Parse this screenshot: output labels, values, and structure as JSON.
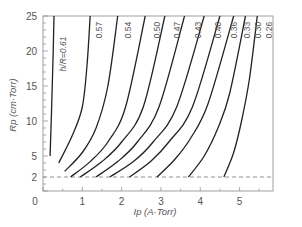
{
  "chart_data": {
    "type": "line",
    "title": "",
    "xlabel": "Ip (A·Torr)",
    "ylabel": "Rp (cm·Torr)",
    "xlim": [
      0,
      5.85
    ],
    "ylim": [
      0,
      25
    ],
    "x_ticks": [
      0,
      1,
      2,
      3,
      4,
      5
    ],
    "y_ticks": [
      2,
      5,
      10,
      15,
      20,
      25
    ],
    "y_minor_step": 1,
    "grid": false,
    "reference_line": {
      "y": 2,
      "style": "dashed"
    },
    "legend_prefix": "h/R=",
    "series": [
      {
        "name": "0.61",
        "points": [
          [
            0.18,
            5
          ],
          [
            0.22,
            12
          ],
          [
            0.26,
            20
          ],
          [
            0.28,
            25
          ]
        ]
      },
      {
        "name": "0.57",
        "points": [
          [
            0.4,
            4
          ],
          [
            0.75,
            8
          ],
          [
            1.0,
            12
          ],
          [
            1.12,
            18
          ],
          [
            1.2,
            25
          ]
        ]
      },
      {
        "name": "0.54",
        "points": [
          [
            0.55,
            2.8
          ],
          [
            1.0,
            5.5
          ],
          [
            1.35,
            9
          ],
          [
            1.65,
            15
          ],
          [
            1.9,
            25
          ]
        ]
      },
      {
        "name": "0.50",
        "points": [
          [
            0.7,
            2
          ],
          [
            1.2,
            4.2
          ],
          [
            1.65,
            7
          ],
          [
            2.1,
            12
          ],
          [
            2.6,
            25
          ]
        ]
      },
      {
        "name": "0.47",
        "points": [
          [
            0.95,
            2
          ],
          [
            1.5,
            4.2
          ],
          [
            2.0,
            7
          ],
          [
            2.55,
            12
          ],
          [
            3.1,
            25
          ]
        ]
      },
      {
        "name": "0.43",
        "points": [
          [
            1.35,
            2
          ],
          [
            1.9,
            4.2
          ],
          [
            2.4,
            7
          ],
          [
            2.95,
            12
          ],
          [
            3.6,
            25
          ]
        ]
      },
      {
        "name": "0.40",
        "points": [
          [
            1.7,
            2
          ],
          [
            2.3,
            4.2
          ],
          [
            2.8,
            7
          ],
          [
            3.4,
            12
          ],
          [
            4.1,
            25
          ]
        ]
      },
      {
        "name": "0.36",
        "points": [
          [
            2.2,
            2
          ],
          [
            2.75,
            4.3
          ],
          [
            3.2,
            7
          ],
          [
            3.8,
            12
          ],
          [
            4.5,
            25
          ]
        ]
      },
      {
        "name": "0.33",
        "points": [
          [
            2.9,
            2
          ],
          [
            3.35,
            4.5
          ],
          [
            3.75,
            7.5
          ],
          [
            4.2,
            12.5
          ],
          [
            4.85,
            25
          ]
        ]
      },
      {
        "name": "0.30",
        "points": [
          [
            3.7,
            2
          ],
          [
            4.1,
            5
          ],
          [
            4.45,
            9
          ],
          [
            4.75,
            14
          ],
          [
            5.15,
            25
          ]
        ]
      },
      {
        "name": "0.26",
        "points": [
          [
            4.6,
            2
          ],
          [
            4.85,
            5.5
          ],
          [
            5.05,
            10
          ],
          [
            5.25,
            16
          ],
          [
            5.45,
            25
          ]
        ]
      }
    ]
  },
  "labels": {
    "y_axis": "Rp (cm·Torr)",
    "x_axis": "Ip (A·Torr)",
    "curve_labels": [
      "h/R=0.61",
      "0.57",
      "0.54",
      "0.50",
      "0.47",
      "0.43",
      "0.40",
      "0.36",
      "0.33",
      "0.30",
      "0.26"
    ]
  }
}
